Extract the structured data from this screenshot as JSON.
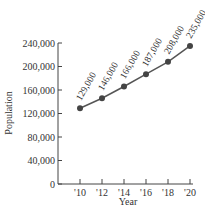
{
  "chart_data": {
    "type": "line",
    "title": "",
    "xlabel": "Year",
    "ylabel": "Population",
    "categories": [
      "'10",
      "'12",
      "'14",
      "'16",
      "'18",
      "'20"
    ],
    "x": [
      2010,
      2012,
      2014,
      2016,
      2018,
      2020
    ],
    "series": [
      {
        "name": "Population",
        "values": [
          129000,
          146000,
          166000,
          187000,
          208000,
          235000
        ]
      }
    ],
    "data_labels": [
      "129,000",
      "146,000",
      "166,000",
      "187,000",
      "208,000",
      "235,000"
    ],
    "yticks": [
      "0",
      "40,000",
      "80,000",
      "120,000",
      "160,000",
      "200,000",
      "240,000"
    ],
    "ylim": [
      0,
      240000
    ],
    "grid": false,
    "legend": "none",
    "line_color": "#555555",
    "marker_color": "#444444"
  }
}
